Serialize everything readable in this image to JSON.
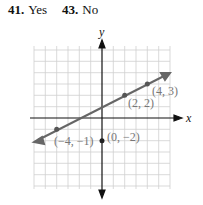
{
  "answers": [
    {
      "number": "41.",
      "text": "Yes"
    },
    {
      "number": "43.",
      "text": "No"
    }
  ],
  "graph": {
    "x_axis_label": "x",
    "y_axis_label": "y",
    "grid_range": {
      "x": [
        -6,
        6
      ],
      "y": [
        -6,
        6
      ]
    },
    "line_color": "#666666",
    "points": [
      {
        "label": "(4, 3)",
        "x": 4,
        "y": 3
      },
      {
        "label": "(2, 2)",
        "x": 2,
        "y": 2
      },
      {
        "label": "(−4, −1)",
        "x": -4,
        "y": -1
      },
      {
        "label": "(0, −2)",
        "x": 0,
        "y": -2
      }
    ]
  }
}
